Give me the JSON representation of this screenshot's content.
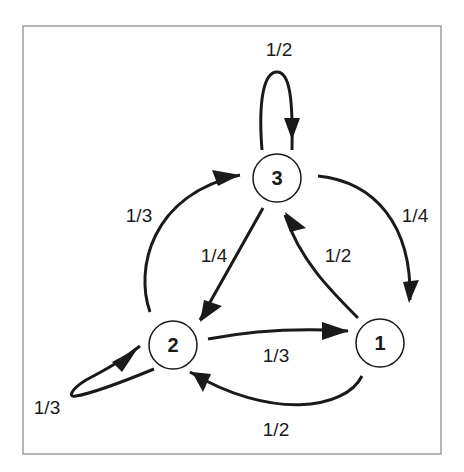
{
  "diagram": {
    "type": "markov-chain-state-diagram",
    "nodes": [
      {
        "id": "1",
        "label": "1"
      },
      {
        "id": "2",
        "label": "2"
      },
      {
        "id": "3",
        "label": "3"
      }
    ],
    "edges": [
      {
        "from": "3",
        "to": "3",
        "label": "1/2"
      },
      {
        "from": "3",
        "to": "1",
        "label": "1/4"
      },
      {
        "from": "3",
        "to": "2",
        "label": "1/4"
      },
      {
        "from": "2",
        "to": "3",
        "label": "1/3"
      },
      {
        "from": "2",
        "to": "1",
        "label": "1/3"
      },
      {
        "from": "2",
        "to": "2",
        "label": "1/3"
      },
      {
        "from": "1",
        "to": "3",
        "label": "1/2"
      },
      {
        "from": "1",
        "to": "2",
        "label": "1/2"
      }
    ]
  },
  "colors": {
    "stroke": "#1a1a1a",
    "frame": "#888888",
    "background": "#ffffff"
  }
}
